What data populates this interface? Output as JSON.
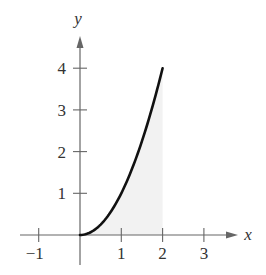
{
  "chart_data": {
    "type": "area",
    "title": "",
    "xlabel": "x",
    "ylabel": "y",
    "xlim": [
      -1.5,
      3.7
    ],
    "ylim": [
      -0.7,
      4.7
    ],
    "grid": false,
    "legend": null,
    "x_ticks": [
      -1,
      1,
      2,
      3
    ],
    "x_tick_labels": [
      "−1",
      "1",
      "2",
      "3"
    ],
    "y_ticks": [
      1,
      2,
      3,
      4
    ],
    "y_tick_labels": [
      "1",
      "2",
      "3",
      "4"
    ],
    "series": [
      {
        "name": "y = x^2",
        "function": "x^2",
        "domain": [
          0,
          2
        ],
        "x": [
          0,
          0.25,
          0.5,
          0.75,
          1,
          1.25,
          1.5,
          1.75,
          2
        ],
        "values": [
          0,
          0.0625,
          0.25,
          0.5625,
          1,
          1.5625,
          2.25,
          3.0625,
          4
        ],
        "color": "#111111"
      }
    ],
    "shaded_region": {
      "description": "Area under curve from x=0 to x=2",
      "from": 0,
      "to": 2,
      "color": "#f2f2f2"
    }
  },
  "colors": {
    "axis": "#666666",
    "curve": "#111111",
    "shade": "#f2f2f2",
    "text": "#333333"
  }
}
